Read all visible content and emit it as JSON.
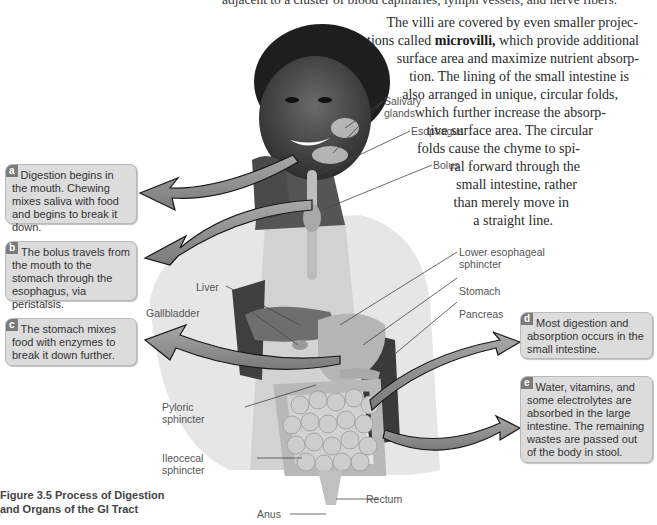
{
  "text": {
    "top_line": "adjacent to a cluster of blood capillaries, lymph vessels, and nerve fibers.",
    "paragraph": [
      {
        "pre": "The villi are covered by even smaller projec-",
        "bold": "",
        "post": ""
      },
      {
        "pre": "tions called ",
        "bold": "microvilli,",
        "post": " which provide additional"
      },
      {
        "pre": "surface area and maximize nutrient absorp-",
        "bold": "",
        "post": ""
      },
      {
        "pre": "tion. The lining of the small intestine is",
        "bold": "",
        "post": ""
      },
      {
        "pre": "also arranged in unique, circular folds,",
        "bold": "",
        "post": ""
      },
      {
        "pre": "which further increase the absorp-",
        "bold": "",
        "post": ""
      },
      {
        "pre": "tive surface area. The circular",
        "bold": "",
        "post": ""
      },
      {
        "pre": "folds cause the chyme to spi-",
        "bold": "",
        "post": ""
      },
      {
        "pre": "ral forward through the",
        "bold": "",
        "post": ""
      },
      {
        "pre": "small intestine, rather",
        "bold": "",
        "post": ""
      },
      {
        "pre": "than merely move in",
        "bold": "",
        "post": ""
      },
      {
        "pre": "a straight line.",
        "bold": "",
        "post": ""
      }
    ]
  },
  "figure": {
    "caption_line1": "Figure 3.5  Process of Digestion",
    "caption_line2": "and Organs of the GI Tract",
    "callouts": [
      {
        "letter": "a",
        "text": "Digestion begins in the mouth. Chewing mixes saliva with food and begins to break it down."
      },
      {
        "letter": "b",
        "text": "The bolus travels from the mouth to the stomach through the esophagus, via peristalsis."
      },
      {
        "letter": "c",
        "text": "The stomach mixes food with enzymes to break it down further."
      },
      {
        "letter": "d",
        "text": "Most digestion and absorption occurs in the small intestine."
      },
      {
        "letter": "e",
        "text": "Water, vitamins, and some electrolytes are absorbed in the large intestine. The remaining wastes are passed out of the body in stool."
      }
    ],
    "labels": {
      "salivary_1": "Salivary",
      "salivary_2": "glands",
      "esophagus": "Esophagus",
      "bolus": "Bolus",
      "les_1": "Lower esophageal",
      "les_2": "sphincter",
      "stomach": "Stomach",
      "pancreas": "Pancreas",
      "liver": "Liver",
      "gallbladder": "Gallbladder",
      "pyloric_1": "Pyloric",
      "pyloric_2": "sphincter",
      "ileocecal_1": "Ileocecal",
      "ileocecal_2": "sphincter",
      "rectum": "Rectum",
      "anus": "Anus"
    },
    "colors": {
      "callout_bg": "#dcdcdc",
      "badge": "#7a7a7a",
      "arrow": "#8c8c8c"
    }
  }
}
